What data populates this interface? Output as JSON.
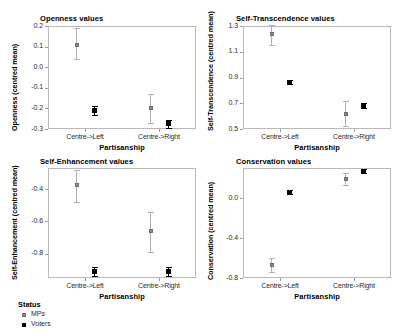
{
  "figure": {
    "cut_off_header_text": "",
    "xaxis_title": "Partisanship",
    "categories": [
      "Centre->Left",
      "Centre->Right"
    ],
    "legend": {
      "title": "Status",
      "entries": [
        {
          "label": "MPs",
          "color": "#8a8a8a",
          "marker": "square-grey"
        },
        {
          "label": "Voters",
          "color": "#000000",
          "marker": "square-black"
        }
      ]
    }
  },
  "chart_data": [
    {
      "type": "scatter",
      "title": "Openness values",
      "xlabel": "Partisanship",
      "ylabel": "Openness (centred mean)",
      "categories": [
        "Centre->Left",
        "Centre->Right"
      ],
      "ylim": [
        -0.3,
        0.2
      ],
      "yticks": [
        "0.2",
        "0.1",
        "0.0",
        "-0.1",
        "-0.2",
        "-0.3"
      ],
      "ytick_values": [
        0.2,
        0.1,
        0.0,
        -0.1,
        -0.2,
        -0.3
      ],
      "grid": false,
      "legend_position": "below-figure",
      "series": [
        {
          "name": "MPs",
          "values": [
            0.11,
            -0.2
          ],
          "ci_low": [
            0.04,
            -0.27
          ],
          "ci_high": [
            0.19,
            -0.13
          ]
        },
        {
          "name": "Voters",
          "values": [
            -0.21,
            -0.275
          ],
          "ci_low": [
            -0.23,
            -0.295
          ],
          "ci_high": [
            -0.19,
            -0.255
          ]
        }
      ]
    },
    {
      "type": "scatter",
      "title": "Self-Transcendence values",
      "xlabel": "Partisanship",
      "ylabel": "Self-Transcendence (centred mean)",
      "categories": [
        "Centre->Left",
        "Centre->Right"
      ],
      "ylim": [
        0.5,
        1.3
      ],
      "yticks": [
        "1.3",
        "1.1",
        "0.9",
        "0.7",
        "0.5"
      ],
      "ytick_values": [
        1.3,
        1.1,
        0.9,
        0.7,
        0.5
      ],
      "grid": false,
      "legend_position": "below-figure",
      "series": [
        {
          "name": "MPs",
          "values": [
            1.24,
            0.62
          ],
          "ci_low": [
            1.15,
            0.52
          ],
          "ci_high": [
            1.31,
            0.72
          ]
        },
        {
          "name": "Voters",
          "values": [
            0.865,
            0.68
          ],
          "ci_low": [
            0.85,
            0.66
          ],
          "ci_high": [
            0.88,
            0.7
          ]
        }
      ]
    },
    {
      "type": "scatter",
      "title": "Self-Enhancement values",
      "xlabel": "Partisanship",
      "ylabel": "Self-Enhancement (centred mean)",
      "categories": [
        "Centre->Left",
        "Centre->Right"
      ],
      "ylim": [
        -0.95,
        -0.27
      ],
      "yticks": [
        "-0.4",
        "-0.6",
        "-0.8"
      ],
      "ytick_values": [
        -0.4,
        -0.6,
        -0.8
      ],
      "grid": false,
      "legend_position": "below-figure",
      "series": [
        {
          "name": "MPs",
          "values": [
            -0.375,
            -0.66
          ],
          "ci_low": [
            -0.48,
            -0.79
          ],
          "ci_high": [
            -0.28,
            -0.54
          ]
        },
        {
          "name": "Voters",
          "values": [
            -0.91,
            -0.91
          ],
          "ci_low": [
            -0.935,
            -0.935
          ],
          "ci_high": [
            -0.885,
            -0.885
          ]
        }
      ]
    },
    {
      "type": "scatter",
      "title": "Conservation values",
      "xlabel": "Partisanship",
      "ylabel": "Conservation (centred mean)",
      "categories": [
        "Centre->Left",
        "Centre->Right"
      ],
      "ylim": [
        -0.8,
        0.3
      ],
      "yticks": [
        "0.0",
        "-0.4",
        "-0.8"
      ],
      "ytick_values": [
        0.0,
        -0.4,
        -0.8
      ],
      "grid": false,
      "legend_position": "below-figure",
      "series": [
        {
          "name": "MPs",
          "values": [
            -0.67,
            0.19
          ],
          "ci_low": [
            -0.74,
            0.13
          ],
          "ci_high": [
            -0.6,
            0.25
          ]
        },
        {
          "name": "Voters",
          "values": [
            0.06,
            0.27
          ],
          "ci_low": [
            0.04,
            0.25
          ],
          "ci_high": [
            0.08,
            0.29
          ]
        }
      ]
    }
  ]
}
